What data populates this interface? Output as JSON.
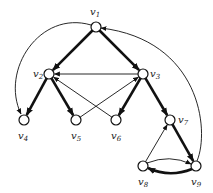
{
  "diagram": {
    "type": "directed-graph",
    "nodes": [
      {
        "id": "v1",
        "label": "v",
        "sub": "1",
        "x": 96,
        "y": 27,
        "lx": 90,
        "ly": 15
      },
      {
        "id": "v2",
        "label": "v",
        "sub": "2",
        "x": 49,
        "y": 74,
        "lx": 33,
        "ly": 77
      },
      {
        "id": "v3",
        "label": "v",
        "sub": "3",
        "x": 143,
        "y": 74,
        "lx": 150,
        "ly": 77
      },
      {
        "id": "v4",
        "label": "v",
        "sub": "4",
        "x": 24,
        "y": 120,
        "lx": 18,
        "ly": 139
      },
      {
        "id": "v5",
        "label": "v",
        "sub": "5",
        "x": 76,
        "y": 120,
        "lx": 71,
        "ly": 139
      },
      {
        "id": "v6",
        "label": "v",
        "sub": "6",
        "x": 116,
        "y": 120,
        "lx": 111,
        "ly": 139
      },
      {
        "id": "v7",
        "label": "v",
        "sub": "7",
        "x": 170,
        "y": 120,
        "lx": 178,
        "ly": 123
      },
      {
        "id": "v8",
        "label": "v",
        "sub": "8",
        "x": 143,
        "y": 166,
        "lx": 138,
        "ly": 185
      },
      {
        "id": "v9",
        "label": "v",
        "sub": "9",
        "x": 196,
        "y": 166,
        "lx": 191,
        "ly": 185
      }
    ],
    "edges": [
      {
        "from": "v1",
        "to": "v2",
        "bold": true
      },
      {
        "from": "v1",
        "to": "v3",
        "bold": true
      },
      {
        "from": "v3",
        "to": "v2",
        "bold": false
      },
      {
        "from": "v2",
        "to": "v4",
        "bold": true
      },
      {
        "from": "v2",
        "to": "v5",
        "bold": true
      },
      {
        "from": "v6",
        "to": "v2",
        "bold": false
      },
      {
        "from": "v5",
        "to": "v3",
        "bold": false
      },
      {
        "from": "v3",
        "to": "v6",
        "bold": true
      },
      {
        "from": "v3",
        "to": "v7",
        "bold": true
      },
      {
        "from": "v7",
        "to": "v9",
        "bold": true
      },
      {
        "from": "v8",
        "to": "v7",
        "bold": false
      },
      {
        "from": "v8",
        "to": "v9",
        "bold": false,
        "curve": "up"
      },
      {
        "from": "v9",
        "to": "v8",
        "bold": true,
        "curve": "down"
      },
      {
        "from": "v1",
        "to": "v4",
        "bold": false,
        "curve": "left-arc"
      },
      {
        "from": "v9",
        "to": "v1",
        "bold": false,
        "curve": "right-arc"
      }
    ]
  }
}
